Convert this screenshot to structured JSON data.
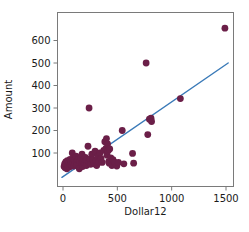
{
  "chart_data": {
    "type": "scatter",
    "title": "",
    "xlabel": "Dollar12",
    "ylabel": "Amount",
    "xlim": [
      -40,
      1620
    ],
    "ylim": [
      -30,
      700
    ],
    "grid": false,
    "legend": null,
    "xticks": [
      0,
      500,
      1000,
      1500
    ],
    "xtick_labels": [
      "0",
      "500",
      "1000",
      "1500"
    ],
    "yticks": [
      100,
      200,
      300,
      400,
      500,
      600
    ],
    "ytick_labels": [
      "100",
      "200",
      "300",
      "400",
      "500",
      "600"
    ],
    "marker_color": "#6b1f48",
    "marker_size": 3.4,
    "line_color": "#3a7ab8",
    "frame_color": "#7a7a7a",
    "points": [
      [
        10,
        40
      ],
      [
        15,
        52
      ],
      [
        20,
        35
      ],
      [
        25,
        60
      ],
      [
        30,
        48
      ],
      [
        35,
        30
      ],
      [
        40,
        66
      ],
      [
        45,
        44
      ],
      [
        55,
        56
      ],
      [
        60,
        38
      ],
      [
        65,
        72
      ],
      [
        70,
        50
      ],
      [
        75,
        62
      ],
      [
        80,
        45
      ],
      [
        85,
        100
      ],
      [
        90,
        58
      ],
      [
        95,
        76
      ],
      [
        100,
        42
      ],
      [
        105,
        68
      ],
      [
        110,
        52
      ],
      [
        120,
        86
      ],
      [
        125,
        60
      ],
      [
        130,
        48
      ],
      [
        140,
        70
      ],
      [
        150,
        30
      ],
      [
        155,
        64
      ],
      [
        165,
        78
      ],
      [
        170,
        55
      ],
      [
        175,
        95
      ],
      [
        180,
        40
      ],
      [
        185,
        62
      ],
      [
        190,
        72
      ],
      [
        195,
        50
      ],
      [
        200,
        58
      ],
      [
        205,
        80
      ],
      [
        210,
        66
      ],
      [
        215,
        44
      ],
      [
        220,
        70
      ],
      [
        230,
        130
      ],
      [
        235,
        62
      ],
      [
        240,
        300
      ],
      [
        245,
        58
      ],
      [
        250,
        74
      ],
      [
        255,
        50
      ],
      [
        265,
        95
      ],
      [
        275,
        70
      ],
      [
        285,
        52
      ],
      [
        295,
        108
      ],
      [
        305,
        66
      ],
      [
        310,
        44
      ],
      [
        320,
        86
      ],
      [
        330,
        60
      ],
      [
        340,
        100
      ],
      [
        350,
        76
      ],
      [
        360,
        58
      ],
      [
        375,
        112
      ],
      [
        385,
        150
      ],
      [
        395,
        120
      ],
      [
        400,
        164
      ],
      [
        405,
        90
      ],
      [
        410,
        140
      ],
      [
        415,
        110
      ],
      [
        420,
        62
      ],
      [
        425,
        55
      ],
      [
        430,
        118
      ],
      [
        440,
        78
      ],
      [
        450,
        44
      ],
      [
        460,
        70
      ],
      [
        470,
        60
      ],
      [
        480,
        56
      ],
      [
        495,
        42
      ],
      [
        510,
        58
      ],
      [
        545,
        200
      ],
      [
        560,
        52
      ],
      [
        640,
        98
      ],
      [
        650,
        55
      ],
      [
        765,
        500
      ],
      [
        780,
        182
      ],
      [
        795,
        250
      ],
      [
        810,
        255
      ],
      [
        815,
        240
      ],
      [
        1080,
        342
      ],
      [
        1490,
        655
      ]
    ],
    "trend_line": {
      "x": [
        -10,
        1520
      ],
      "y": [
        -8,
        500
      ]
    }
  }
}
